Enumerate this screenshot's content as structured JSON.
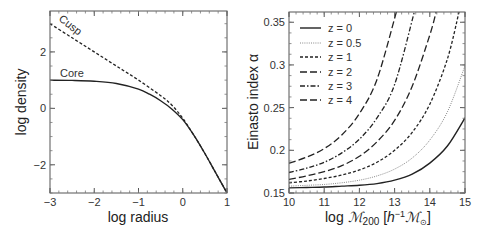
{
  "chart_data": [
    {
      "type": "line",
      "title": "",
      "xlabel": "log radius",
      "ylabel": "log density",
      "xlim": [
        -3,
        1
      ],
      "ylim": [
        -3,
        3.45
      ],
      "xticks": [
        -3,
        -2,
        -1,
        0,
        1
      ],
      "xtick_labels": [
        "−3",
        "−2",
        "−1",
        "0",
        "1"
      ],
      "yticks": [
        -2,
        0,
        2
      ],
      "ytick_labels": [
        "−2",
        "0",
        "2"
      ],
      "grid": false,
      "series": [
        {
          "name": "Cusp",
          "style": "dashed",
          "x": [
            -3.0,
            -2.5,
            -2.0,
            -1.5,
            -1.0,
            -0.5,
            -0.25,
            0.0,
            0.25,
            0.5,
            0.75,
            1.0
          ],
          "y": [
            3.0,
            2.5,
            2.0,
            1.5,
            1.0,
            0.45,
            0.12,
            -0.35,
            -0.95,
            -1.6,
            -2.3,
            -3.0
          ]
        },
        {
          "name": "Core",
          "style": "solid",
          "x": [
            -3.0,
            -2.5,
            -2.0,
            -1.5,
            -1.0,
            -0.75,
            -0.5,
            -0.25,
            0.0,
            0.25,
            0.5,
            0.75,
            1.0
          ],
          "y": [
            1.0,
            0.99,
            0.96,
            0.88,
            0.68,
            0.5,
            0.27,
            -0.02,
            -0.4,
            -0.95,
            -1.6,
            -2.3,
            -3.0
          ]
        }
      ],
      "annotations": [
        {
          "text": "Cusp",
          "x": -2.7,
          "y": 3.05,
          "rotation": 38
        },
        {
          "text": "Core",
          "x": -2.8,
          "y": 1.25
        }
      ]
    },
    {
      "type": "line",
      "title": "",
      "xlabel": "log ℳ200 [h⁻¹ℳ⊙]",
      "ylabel": "Einasto index α",
      "xlim": [
        10,
        15
      ],
      "ylim": [
        0.15,
        0.362
      ],
      "xticks": [
        10,
        11,
        12,
        13,
        14,
        15
      ],
      "xtick_labels": [
        "10",
        "11",
        "12",
        "13",
        "14",
        "15"
      ],
      "yticks": [
        0.15,
        0.2,
        0.25,
        0.3,
        0.35
      ],
      "ytick_labels": [
        "0.15",
        "0.2",
        "0.25",
        "0.3",
        "0.35"
      ],
      "grid": false,
      "legend_position": "upper left",
      "series": [
        {
          "name": "z = 0",
          "style": "solid",
          "x": [
            10,
            10.5,
            11,
            11.5,
            12,
            12.5,
            13,
            13.5,
            14,
            14.5,
            15
          ],
          "y": [
            0.156,
            0.1565,
            0.157,
            0.158,
            0.159,
            0.161,
            0.165,
            0.172,
            0.185,
            0.205,
            0.238
          ]
        },
        {
          "name": "z = 0.5",
          "style": "dotted",
          "x": [
            10,
            10.5,
            11,
            11.5,
            12,
            12.5,
            13,
            13.5,
            14,
            14.5,
            15
          ],
          "y": [
            0.158,
            0.159,
            0.16,
            0.162,
            0.165,
            0.17,
            0.178,
            0.191,
            0.212,
            0.245,
            0.299
          ]
        },
        {
          "name": "z = 1",
          "style": "short-dash",
          "x": [
            10,
            10.5,
            11,
            11.5,
            12,
            12.5,
            13,
            13.5,
            14,
            14.5,
            14.83
          ],
          "y": [
            0.162,
            0.164,
            0.167,
            0.171,
            0.177,
            0.186,
            0.2,
            0.221,
            0.254,
            0.307,
            0.362
          ]
        },
        {
          "name": "z = 2",
          "style": "long-dash",
          "x": [
            10,
            10.5,
            11,
            11.5,
            12,
            12.5,
            13,
            13.5,
            14,
            14.18
          ],
          "y": [
            0.166,
            0.17,
            0.175,
            0.182,
            0.193,
            0.21,
            0.235,
            0.275,
            0.335,
            0.362
          ]
        },
        {
          "name": "z = 3",
          "style": "dash-dot",
          "x": [
            10,
            10.5,
            11,
            11.5,
            12,
            12.5,
            13,
            13.56
          ],
          "y": [
            0.174,
            0.179,
            0.186,
            0.197,
            0.213,
            0.238,
            0.277,
            0.362
          ]
        },
        {
          "name": "z = 4",
          "style": "long-dash",
          "x": [
            10,
            10.5,
            11,
            11.5,
            12,
            12.5,
            13.05
          ],
          "y": [
            0.185,
            0.192,
            0.202,
            0.218,
            0.243,
            0.283,
            0.362
          ]
        }
      ]
    }
  ],
  "left_panel": {
    "xlabel": "log radius",
    "ylabel": "log density",
    "annotation_cusp": "Cusp",
    "annotation_core": "Core",
    "xtick_labels": [
      "−3",
      "−2",
      "−1",
      "0",
      "1"
    ],
    "ytick_labels": [
      "−2",
      "0",
      "2"
    ]
  },
  "right_panel": {
    "ylabel": "Einasto index α",
    "xlabel_prefix": "log ",
    "xlabel_M": "ℳ",
    "xlabel_sub": "200",
    "xlabel_bracket_open": " [",
    "xlabel_h": "h",
    "xlabel_sup": "−1",
    "xlabel_Msun": "ℳ",
    "xlabel_sun_sub": "⊙",
    "xlabel_bracket_close": "]",
    "xtick_labels": [
      "10",
      "11",
      "12",
      "13",
      "14",
      "15"
    ],
    "ytick_labels": [
      "0.15",
      "0.2",
      "0.25",
      "0.3",
      "0.35"
    ],
    "legend": [
      "z = 0",
      "z = 0.5",
      "z = 1",
      "z = 2",
      "z = 3",
      "z = 4"
    ]
  }
}
